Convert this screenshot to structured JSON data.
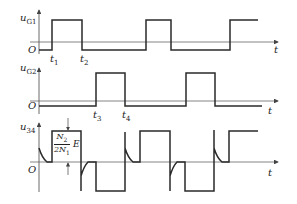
{
  "diagram": {
    "type": "timing-diagram",
    "time_axis_label": "t",
    "origin_label": "O",
    "panels": [
      {
        "id": "uG1",
        "y_label": "u",
        "y_label_sub": "G1",
        "time_markers": [
          {
            "label": "t",
            "sub": "1"
          },
          {
            "label": "t",
            "sub": "2"
          }
        ],
        "description": "Gate pulse 1: square wave high during t1–t2 and repeating"
      },
      {
        "id": "uG2",
        "y_label": "u",
        "y_label_sub": "G2",
        "time_markers": [
          {
            "label": "t",
            "sub": "3"
          },
          {
            "label": "t",
            "sub": "4"
          }
        ],
        "description": "Gate pulse 2: square wave high during t3–t4, phase-shifted by half period"
      },
      {
        "id": "u34",
        "y_label": "u",
        "y_label_sub": "34",
        "amplitude_annotation": {
          "numerator": "N",
          "numerator_sub": "2",
          "denominator": "2N",
          "denominator_sub": "1",
          "suffix": "E"
        },
        "description": "Transformer output voltage: bipolar square wave with spikes at transitions"
      }
    ]
  },
  "colors": {
    "trace": "#2a2a2a",
    "axis": "#555555",
    "background": "#ffffff"
  }
}
